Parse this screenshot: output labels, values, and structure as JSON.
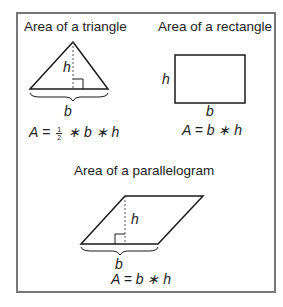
{
  "triangle": {
    "title": "Area of a triangle",
    "height_label": "h",
    "base_label": "b",
    "formula": {
      "lhs": "A",
      "eq": "=",
      "num": "1",
      "den": "2",
      "rest": "∗ b ∗ h"
    }
  },
  "rectangle": {
    "title": "Area of a rectangle",
    "height_label": "h",
    "base_label": "b",
    "formula": "A = b ∗ h"
  },
  "parallelogram": {
    "title": "Area of a parallelogram",
    "height_label": "h",
    "base_label": "b",
    "formula": "A = b ∗ h"
  },
  "colors": {
    "stroke": "#1a1a1a",
    "frame": "#777777",
    "dashed": "#555555"
  }
}
